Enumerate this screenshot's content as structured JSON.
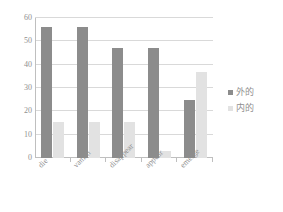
{
  "chart_data": {
    "type": "bar",
    "title": "",
    "xlabel": "",
    "ylabel": "",
    "categories": [
      "die",
      "vanish",
      "disappear",
      "appear",
      "emerge"
    ],
    "series": [
      {
        "name": "外的",
        "color": "#8c8c8c",
        "values": [
          56,
          56,
          47,
          47,
          25
        ]
      },
      {
        "name": "内的",
        "color": "#e2e2e2",
        "values": [
          15.5,
          15.5,
          15.5,
          3,
          37
        ]
      }
    ],
    "ylim": [
      0,
      60
    ],
    "yticks": [
      0,
      10,
      20,
      30,
      40,
      50,
      60
    ],
    "ytick_labels": [
      "0",
      "10",
      "20",
      "30",
      "40",
      "50",
      "60"
    ],
    "grid": true,
    "legend_position": "right"
  }
}
